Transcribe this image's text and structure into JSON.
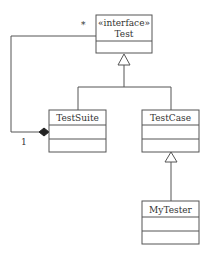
{
  "diagram": {
    "type": "uml-class-diagram",
    "classes": [
      {
        "id": "test",
        "stereotype": "«interface»",
        "name": "Test"
      },
      {
        "id": "testsuite",
        "name": "TestSuite"
      },
      {
        "id": "testcase",
        "name": "TestCase"
      },
      {
        "id": "mytester",
        "name": "MyTester"
      }
    ],
    "relationships": [
      {
        "type": "realization",
        "from": "TestSuite",
        "to": "Test"
      },
      {
        "type": "realization",
        "from": "TestCase",
        "to": "Test"
      },
      {
        "type": "generalization",
        "from": "MyTester",
        "to": "TestCase"
      },
      {
        "type": "composition",
        "whole": "TestSuite",
        "part": "Test",
        "whole_multiplicity": "1",
        "part_multiplicity": "*"
      }
    ],
    "labels": {
      "part_multiplicity": "*",
      "whole_multiplicity": "1"
    },
    "colors": {
      "line": "#555555",
      "text": "#333333",
      "background": "#ffffff"
    }
  }
}
